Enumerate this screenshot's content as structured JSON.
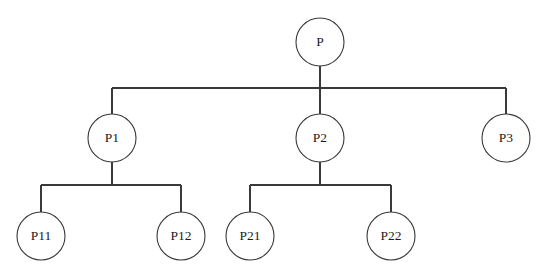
{
  "diagram": {
    "type": "tree",
    "title": "",
    "background_color": "#ffffff",
    "line_color": "#3a3a3a",
    "text_color": "#1c1c1c",
    "node_fill": "#ffffff",
    "node_radius": 24,
    "nodes": [
      {
        "id": "P",
        "label": "P",
        "level": 0,
        "cx": 320,
        "cy": 42,
        "parent": null
      },
      {
        "id": "P1",
        "label": "P1",
        "level": 1,
        "cx": 112,
        "cy": 138,
        "parent": "P"
      },
      {
        "id": "P2",
        "label": "P2",
        "level": 1,
        "cx": 320,
        "cy": 138,
        "parent": "P"
      },
      {
        "id": "P3",
        "label": "P3",
        "level": 1,
        "cx": 506,
        "cy": 138,
        "parent": "P"
      },
      {
        "id": "P11",
        "label": "P11",
        "level": 2,
        "cx": 41,
        "cy": 236,
        "parent": "P1"
      },
      {
        "id": "P12",
        "label": "P12",
        "level": 2,
        "cx": 181,
        "cy": 236,
        "parent": "P1"
      },
      {
        "id": "P21",
        "label": "P21",
        "level": 2,
        "cx": 250,
        "cy": 236,
        "parent": "P2"
      },
      {
        "id": "P22",
        "label": "P22",
        "level": 2,
        "cx": 391,
        "cy": 236,
        "parent": "P2"
      }
    ],
    "connectors": [
      {
        "id": "stem-P",
        "from": "P",
        "path": "M320 66 L320 88"
      },
      {
        "id": "bus-P",
        "from": "P",
        "path": "M112 88 L506 88"
      },
      {
        "id": "drop-P1",
        "to": "P1",
        "path": "M112 88 L112 114"
      },
      {
        "id": "drop-P2",
        "to": "P2",
        "path": "M320 88 L320 114"
      },
      {
        "id": "drop-P3",
        "to": "P3",
        "path": "M506 88 L506 114"
      },
      {
        "id": "stem-P1",
        "from": "P1",
        "path": "M112 162 L112 185"
      },
      {
        "id": "bus-P1",
        "from": "P1",
        "path": "M41 185 L181 185"
      },
      {
        "id": "drop-P11",
        "to": "P11",
        "path": "M41 185 L41 212"
      },
      {
        "id": "drop-P12",
        "to": "P12",
        "path": "M181 185 L181 212"
      },
      {
        "id": "stem-P2",
        "from": "P2",
        "path": "M320 162 L320 185"
      },
      {
        "id": "bus-P2",
        "from": "P2",
        "path": "M250 185 L391 185"
      },
      {
        "id": "drop-P21",
        "to": "P21",
        "path": "M250 185 L250 212"
      },
      {
        "id": "drop-P22",
        "to": "P22",
        "path": "M391 185 L391 212"
      }
    ]
  }
}
